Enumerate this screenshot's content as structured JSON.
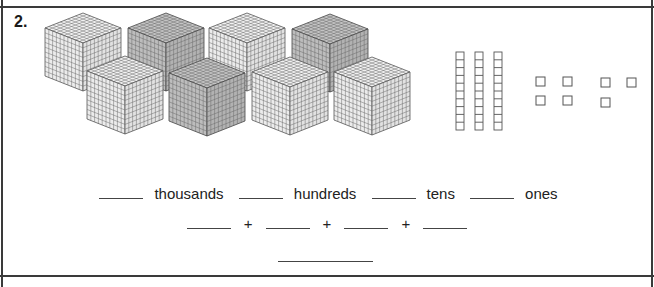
{
  "problem": {
    "number": "2.",
    "model": {
      "thousands_cubes": 8,
      "hundreds_flats": 0,
      "tens_rods": 3,
      "ones_units": 7
    },
    "place_value_row": {
      "labels": [
        "thousands",
        "hundreds",
        "tens",
        "ones"
      ],
      "blanks": [
        "",
        "",
        "",
        ""
      ]
    },
    "expanded_form_row": {
      "operator": "+",
      "blanks": [
        "",
        "",
        "",
        ""
      ]
    },
    "standard_form_answer": ""
  },
  "colors": {
    "cube_light_fill": "#f4f4f4",
    "cube_dark_fill": "#b9b9b9",
    "grid_line": "#555555",
    "border": "#3a3a3a"
  }
}
